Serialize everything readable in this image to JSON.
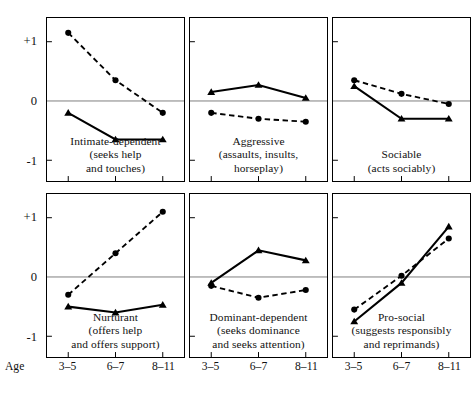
{
  "figure": {
    "age_axis_label": "Age",
    "y_ticks": [
      "+1",
      "0",
      "-1"
    ],
    "x_ticks": [
      "3–5",
      "6–7",
      "8–11"
    ]
  },
  "chart_data": {
    "type": "line",
    "title": "",
    "subtitle": "",
    "xlabel": "Age",
    "ylabel": "",
    "x": [
      "3–5",
      "6–7",
      "8–11"
    ],
    "ylim": [
      -1.35,
      1.4
    ],
    "yticks": [
      1,
      0,
      -1
    ],
    "ytick_labels": [
      "+1",
      "0",
      "-1"
    ],
    "grid": false,
    "zero_line": true,
    "legend": "none",
    "series_styles": [
      {
        "name": "circle-dashed",
        "marker": "circle",
        "line": "dashed",
        "color": "#000000"
      },
      {
        "name": "triangle-solid",
        "marker": "triangle",
        "line": "solid",
        "color": "#000000"
      }
    ],
    "panels": [
      {
        "id": "intimate-dependent",
        "title": "Intimate-dependent",
        "caption_lines": [
          "Intimate-dependent",
          "(seeks help",
          "and touches)"
        ],
        "series": [
          {
            "name": "circle-dashed",
            "marker": "circle",
            "line": "dashed",
            "values": [
              1.15,
              0.35,
              -0.2
            ]
          },
          {
            "name": "triangle-solid",
            "marker": "triangle",
            "line": "solid",
            "values": [
              -0.2,
              -0.65,
              -0.65
            ]
          }
        ]
      },
      {
        "id": "aggressive",
        "title": "Aggressive",
        "caption_lines": [
          "Aggressive",
          "(assaults, insults,",
          "horseplay)"
        ],
        "series": [
          {
            "name": "circle-dashed",
            "marker": "circle",
            "line": "dashed",
            "values": [
              -0.2,
              -0.3,
              -0.35
            ]
          },
          {
            "name": "triangle-solid",
            "marker": "triangle",
            "line": "solid",
            "values": [
              0.15,
              0.27,
              0.05
            ]
          }
        ]
      },
      {
        "id": "sociable",
        "title": "Sociable",
        "caption_lines": [
          "Sociable",
          "(acts sociably)"
        ],
        "series": [
          {
            "name": "circle-dashed",
            "marker": "circle",
            "line": "dashed",
            "values": [
              0.35,
              0.12,
              -0.05
            ]
          },
          {
            "name": "triangle-solid",
            "marker": "triangle",
            "line": "solid",
            "values": [
              0.25,
              -0.3,
              -0.3
            ]
          }
        ]
      },
      {
        "id": "nurturant",
        "title": "Nurturant",
        "caption_lines": [
          "Nurturant",
          "(offers help",
          "and offers support)"
        ],
        "series": [
          {
            "name": "circle-dashed",
            "marker": "circle",
            "line": "dashed",
            "values": [
              -0.3,
              0.4,
              1.1
            ]
          },
          {
            "name": "triangle-solid",
            "marker": "triangle",
            "line": "solid",
            "values": [
              -0.5,
              -0.6,
              -0.47
            ]
          }
        ]
      },
      {
        "id": "dominant-dependent",
        "title": "Dominant-dependent",
        "caption_lines": [
          "Dominant-dependent",
          "(seeks dominance",
          "and seeks attention)"
        ],
        "series": [
          {
            "name": "circle-dashed",
            "marker": "circle",
            "line": "dashed",
            "values": [
              -0.15,
              -0.35,
              -0.22
            ]
          },
          {
            "name": "triangle-solid",
            "marker": "triangle",
            "line": "solid",
            "values": [
              -0.1,
              0.45,
              0.28
            ]
          }
        ]
      },
      {
        "id": "pro-social",
        "title": "Pro-social",
        "caption_lines": [
          "Pro-social",
          "(suggests responsibly",
          "and reprimands)"
        ],
        "series": [
          {
            "name": "circle-dashed",
            "marker": "circle",
            "line": "dashed",
            "values": [
              -0.55,
              0.02,
              0.65
            ]
          },
          {
            "name": "triangle-solid",
            "marker": "triangle",
            "line": "solid",
            "values": [
              -0.75,
              -0.1,
              0.85
            ]
          }
        ]
      }
    ]
  }
}
